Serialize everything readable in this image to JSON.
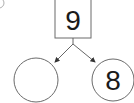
{
  "diagram": {
    "type": "number-bond",
    "problem_marker": "⑤",
    "whole": "9",
    "parts": [
      "",
      "8"
    ],
    "colors": {
      "stroke": "#6b6b6b",
      "text": "#1a1a1a",
      "arrow": "#333333",
      "background": "#ffffff"
    }
  }
}
